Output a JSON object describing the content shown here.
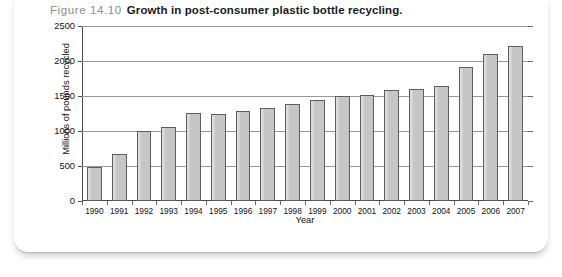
{
  "caption": {
    "figure_number": "Figure 14.10",
    "title": "Growth in post-consumer plastic bottle recycling."
  },
  "chart_data": {
    "type": "bar",
    "title": "Growth in post-consumer plastic bottle recycling.",
    "xlabel": "Year",
    "ylabel": "Millions of pounds recycled",
    "ylim": [
      0,
      2500
    ],
    "yticks": [
      0,
      500,
      1000,
      1500,
      2000,
      2500
    ],
    "ytick_labels": [
      "0",
      "500",
      "1000",
      "1500",
      "2000",
      "2500"
    ],
    "grid": true,
    "legend": "none",
    "categories": [
      "1990",
      "1991",
      "1992",
      "1993",
      "1994",
      "1995",
      "1996",
      "1997",
      "1998",
      "1999",
      "2000",
      "2001",
      "2002",
      "2003",
      "2004",
      "2005",
      "2006",
      "2007"
    ],
    "values": [
      490,
      670,
      1000,
      1060,
      1260,
      1250,
      1290,
      1330,
      1380,
      1450,
      1500,
      1510,
      1580,
      1600,
      1650,
      1920,
      2100,
      2210
    ],
    "bar_color": "#c9c9c9",
    "bar_edge_color": "#5e5e5e"
  }
}
